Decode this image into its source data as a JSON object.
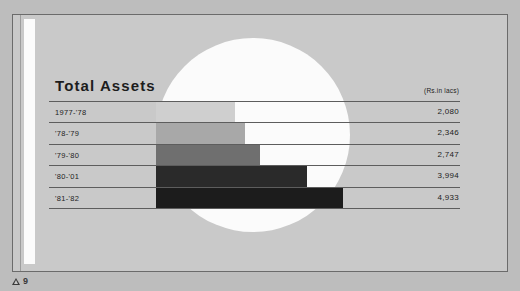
{
  "folio": {
    "marker_icon": "triangle-icon",
    "page_number": "9"
  },
  "chart_data": {
    "type": "bar",
    "title": "Total Assets",
    "units_note": "(Rs.in lacs)",
    "xlabel": "",
    "ylabel": "",
    "orientation": "horizontal",
    "grid": true,
    "legend": false,
    "xlim": [
      0,
      4933
    ],
    "categories": [
      "1977-'78",
      "'78-'79",
      "'79-'80",
      "'80-'81",
      "'81-'82"
    ],
    "values": [
      2080,
      2346,
      2747,
      3994,
      4933
    ],
    "value_labels": [
      "2,080",
      "2,346",
      "2,747",
      "3,994",
      "4,933"
    ],
    "bar_colors": [
      "#cfcfcf",
      "#a8a8a8",
      "#6f6f6f",
      "#2a2a2a",
      "#1c1c1c"
    ],
    "rows": [
      {
        "category": "1977-'78",
        "value": 2080,
        "label": "2,080",
        "color": "#cfcfcf"
      },
      {
        "category": "'78-'79",
        "value": 2346,
        "label": "2,346",
        "color": "#a8a8a8"
      },
      {
        "category": "'79-'80",
        "value": 2747,
        "label": "2,747",
        "color": "#6f6f6f"
      },
      {
        "category": "'80-'01",
        "value": 3994,
        "label": "3,994",
        "color": "#2a2a2a"
      },
      {
        "category": "'81-'82",
        "value": 4933,
        "label": "4,933",
        "color": "#1c1c1c"
      }
    ]
  },
  "colors": {
    "page_background": "#bdbdbd",
    "panel_background": "#c9c9c9",
    "panel_border": "#6b6b6b",
    "circle": "#fbfbfb",
    "rule": "#5d5d5d",
    "text": "#1d1d1d"
  }
}
